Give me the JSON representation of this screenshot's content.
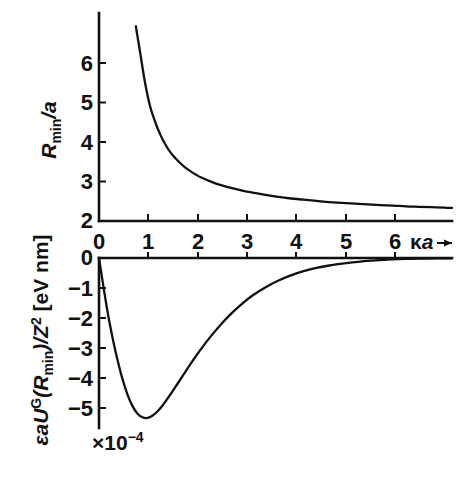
{
  "figure": {
    "name": "two-panel-plot",
    "background_color": "#ffffff",
    "line_color": "#111111"
  },
  "panels": {
    "top": {
      "ylabel_parts": {
        "main": "R",
        "subscript": "min",
        "divider": "/a"
      },
      "ylabel_text": "R_min/a",
      "yticks": [
        "2",
        "3",
        "4",
        "5",
        "6"
      ],
      "ytick_values": [
        2,
        3,
        4,
        5,
        6
      ]
    },
    "bottom": {
      "ylabel_parts": {
        "prefix": "εaU",
        "superscript": "G",
        "argument_open": "(R",
        "argument_sub": "min",
        "argument_close": ")/Z",
        "z_exponent": "2",
        "units": " [eV nm]"
      },
      "ylabel_text": "εaUᴳ(R_min)/Z² [eV nm]",
      "yticks": [
        "0",
        "−1",
        "−2",
        "−3",
        "−4",
        "−5"
      ],
      "ytick_values": [
        0,
        -1,
        -2,
        -3,
        -4,
        -5
      ],
      "scale_annotation": {
        "mantissa": "×10",
        "exponent": "−4",
        "text": "×10⁻⁴"
      }
    }
  },
  "xaxis": {
    "ticks": [
      "0",
      "1",
      "2",
      "3",
      "4",
      "5",
      "6"
    ],
    "tick_values": [
      0,
      1,
      2,
      3,
      4,
      5,
      6
    ],
    "label_parts": {
      "kappa": "κ",
      "a": "a"
    },
    "label_text": "κa",
    "has_arrow": true
  },
  "chart_data": [
    {
      "type": "line",
      "id": "top-panel",
      "title": "",
      "xlabel": "κa",
      "ylabel": "R_min/a",
      "xlim": [
        0,
        6.9
      ],
      "ylim": [
        2,
        6.95
      ],
      "grid": false,
      "legend": null,
      "xticks": [
        0,
        1,
        2,
        3,
        4,
        5,
        6
      ],
      "yticks": [
        2,
        3,
        4,
        5,
        6
      ],
      "series": [
        {
          "name": "R_min/a",
          "x": [
            0.72,
            0.8,
            0.9,
            1.0,
            1.1,
            1.2,
            1.3,
            1.4,
            1.5,
            1.6,
            1.7,
            1.8,
            1.9,
            2.0,
            2.2,
            2.4,
            2.6,
            2.8,
            3.0,
            3.25,
            3.5,
            3.75,
            4.0,
            4.25,
            4.5,
            4.75,
            5.0,
            5.25,
            5.5,
            5.75,
            6.0,
            6.25,
            6.5,
            6.75,
            6.9
          ],
          "y": [
            6.93,
            6.3,
            5.5,
            4.9,
            4.5,
            4.18,
            3.93,
            3.73,
            3.58,
            3.45,
            3.34,
            3.25,
            3.17,
            3.1,
            2.99,
            2.9,
            2.83,
            2.77,
            2.72,
            2.66,
            2.61,
            2.57,
            2.54,
            2.51,
            2.48,
            2.46,
            2.44,
            2.42,
            2.4,
            2.39,
            2.37,
            2.36,
            2.35,
            2.34,
            2.33
          ]
        }
      ]
    },
    {
      "type": "line",
      "id": "bottom-panel",
      "title": "",
      "xlabel": "κa",
      "ylabel": "εaUᴳ(R_min)/Z² [eV nm]",
      "y_scale_factor": "1e-4",
      "xlim": [
        0,
        6.9
      ],
      "ylim": [
        -5.6,
        0.2
      ],
      "grid": false,
      "legend": null,
      "xticks": [
        0,
        1,
        2,
        3,
        4,
        5,
        6
      ],
      "yticks": [
        0,
        -1,
        -2,
        -3,
        -4,
        -5
      ],
      "series": [
        {
          "name": "εaUᴳ(R_min)/Z²",
          "x": [
            0.0,
            0.05,
            0.1,
            0.15,
            0.2,
            0.28,
            0.36,
            0.45,
            0.55,
            0.65,
            0.75,
            0.85,
            0.95,
            1.05,
            1.15,
            1.25,
            1.4,
            1.55,
            1.7,
            1.85,
            2.0,
            2.2,
            2.4,
            2.6,
            2.8,
            3.0,
            3.25,
            3.5,
            3.75,
            4.0,
            4.25,
            4.5,
            4.75,
            5.0,
            5.3,
            5.6,
            6.0,
            6.4,
            6.9
          ],
          "y": [
            0.0,
            -0.55,
            -1.1,
            -1.62,
            -2.1,
            -2.78,
            -3.38,
            -3.98,
            -4.52,
            -4.92,
            -5.18,
            -5.31,
            -5.33,
            -5.25,
            -5.1,
            -4.9,
            -4.54,
            -4.15,
            -3.76,
            -3.38,
            -3.02,
            -2.58,
            -2.18,
            -1.83,
            -1.52,
            -1.25,
            -0.98,
            -0.76,
            -0.58,
            -0.44,
            -0.33,
            -0.25,
            -0.19,
            -0.14,
            -0.09,
            -0.06,
            -0.03,
            -0.02,
            -0.01
          ]
        }
      ]
    }
  ]
}
